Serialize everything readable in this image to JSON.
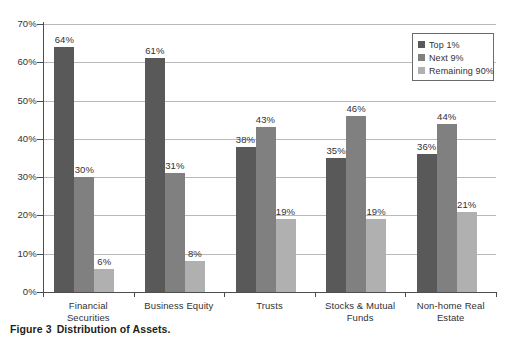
{
  "caption": {
    "number": "Figure 3",
    "text": "Distribution of Assets."
  },
  "chart_data": {
    "type": "bar",
    "title": "",
    "subtitle": "",
    "xlabel": "",
    "ylabel": "",
    "ylim": [
      0,
      70
    ],
    "ytick_step": 10,
    "grid": true,
    "legend_position": "top-right inside plot",
    "value_suffix": "%",
    "categories": [
      "Financial Securities",
      "Business Equity",
      "Trusts",
      "Stocks & Mutual Funds",
      "Non-home Real Estate"
    ],
    "category_lines": [
      [
        "Financial",
        "Securities"
      ],
      [
        "Business Equity"
      ],
      [
        "Trusts"
      ],
      [
        "Stocks & Mutual",
        "Funds"
      ],
      [
        "Non-home Real",
        "Estate"
      ]
    ],
    "ytick_labels": [
      "0%",
      "10%",
      "20%",
      "30%",
      "40%",
      "50%",
      "60%",
      "70%"
    ],
    "ytick_values": [
      0,
      10,
      20,
      30,
      40,
      50,
      60,
      70
    ],
    "series": [
      {
        "name": "Top 1%",
        "color": "#595959",
        "values": [
          64,
          61,
          38,
          35,
          36
        ],
        "labels": [
          "64%",
          "61%",
          "38%",
          "35%",
          "36%"
        ]
      },
      {
        "name": "Next 9%",
        "color": "#808080",
        "values": [
          30,
          31,
          43,
          46,
          44
        ],
        "labels": [
          "30%",
          "31%",
          "43%",
          "46%",
          "44%"
        ]
      },
      {
        "name": "Remaining 90%",
        "color": "#b0b0b0",
        "values": [
          6,
          8,
          19,
          19,
          21
        ],
        "labels": [
          "6%",
          "8%",
          "19%",
          "19%",
          "21%"
        ]
      }
    ]
  },
  "colors": {
    "series_1": "#595959",
    "series_2": "#808080",
    "series_3": "#b0b0b0",
    "axis": "#4d4d4d",
    "gridline": "#b9b9b9",
    "text": "#333132",
    "caption_text": "#231f20",
    "background": "#ffffff"
  }
}
